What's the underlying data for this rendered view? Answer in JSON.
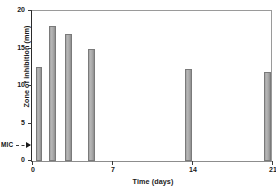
{
  "chart_data": {
    "type": "bar",
    "title": "",
    "xlabel": "Time (days)",
    "ylabel": "Zone of inhibition (mm)",
    "xlim": [
      0,
      21
    ],
    "ylim": [
      0,
      20
    ],
    "grid": false,
    "legend": null,
    "xticks": [
      "0",
      "7",
      "14",
      "21"
    ],
    "xtick_values": [
      0,
      7,
      14,
      21
    ],
    "yticks": [
      "0",
      "5",
      "10",
      "15",
      "20"
    ],
    "ytick_values": [
      0,
      5,
      10,
      15,
      20
    ],
    "x": [
      0.6,
      1.8,
      3.2,
      5.2,
      13.7,
      20.6
    ],
    "values": [
      12.5,
      18.0,
      17.0,
      15.0,
      12.3,
      11.9
    ],
    "bar_width_days": 0.55,
    "bar_color": "#ababab",
    "bar_edge_color": "#7a7a7a",
    "annotations": [
      {
        "name": "mic",
        "label": "MIC",
        "y_value": 2.2,
        "marker": "arrowhead-right",
        "leader": "dashed"
      }
    ]
  }
}
